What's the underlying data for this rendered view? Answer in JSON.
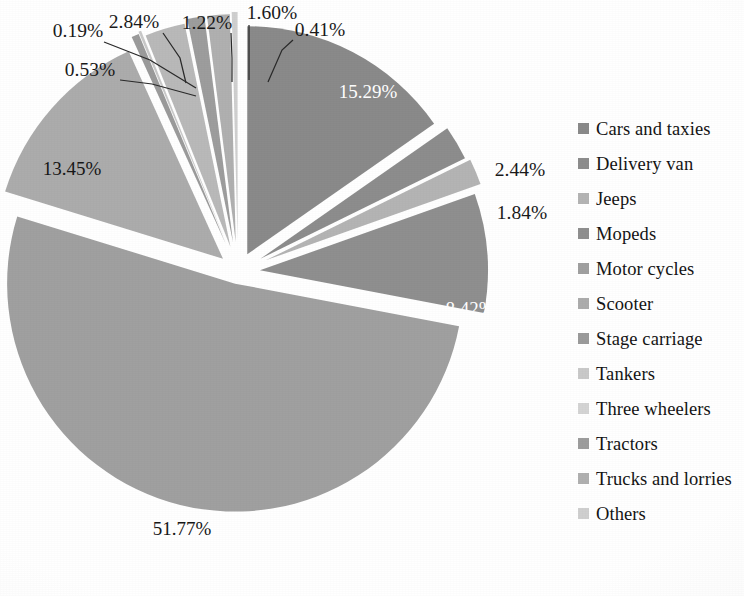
{
  "chart_data": {
    "type": "pie",
    "title": "",
    "subtitle": "",
    "xlabel": "",
    "ylabel": "",
    "legend_position": "right",
    "grid": false,
    "exploded": true,
    "value_suffix": "%",
    "categories": [
      "Cars and taxies",
      "Delivery van",
      "Jeeps",
      "Mopeds",
      "Motor cycles",
      "Scooter",
      "Stage carriage",
      "Tankers",
      "Three wheelers",
      "Tractors",
      "Trucks and lorries",
      "Others"
    ],
    "values": [
      15.29,
      2.44,
      1.84,
      8.42,
      51.77,
      13.45,
      0.53,
      0.19,
      2.84,
      1.22,
      1.6,
      0.41
    ],
    "labels": [
      "15.29%",
      "2.44%",
      "1.84%",
      "8.42%",
      "51.77%",
      "13.45%",
      "0.53%",
      "0.19%",
      "2.84%",
      "1.22%",
      "1.60%",
      "0.41%"
    ],
    "colors": [
      "#8a8a8a",
      "#8d8d8d",
      "#b4b4b4",
      "#8f8f8f",
      "#a0a0a0",
      "#acacac",
      "#9b9b9b",
      "#c9c9c9",
      "#b9b9b9",
      "#9d9d9d",
      "#b0b0b0",
      "#cfcfcf"
    ],
    "label_placement": [
      "inside",
      "outside",
      "outside",
      "inside",
      "inside",
      "inside",
      "callout",
      "callout",
      "callout",
      "callout",
      "callout",
      "callout"
    ]
  },
  "legend": {
    "items": [
      {
        "label": "Cars and taxies",
        "color": "#8a8a8a"
      },
      {
        "label": "Delivery van",
        "color": "#8d8d8d"
      },
      {
        "label": "Jeeps",
        "color": "#b4b4b4"
      },
      {
        "label": "Mopeds",
        "color": "#8f8f8f"
      },
      {
        "label": "Motor cycles",
        "color": "#a0a0a0"
      },
      {
        "label": "Scooter",
        "color": "#acacac"
      },
      {
        "label": "Stage carriage",
        "color": "#9b9b9b"
      },
      {
        "label": "Tankers",
        "color": "#c9c9c9"
      },
      {
        "label": "Three wheelers",
        "color": "#d4d4d4"
      },
      {
        "label": "Tractors",
        "color": "#9d9d9d"
      },
      {
        "label": "Trucks and lorries",
        "color": "#b0b0b0"
      },
      {
        "label": "Others",
        "color": "#cfcfcf"
      }
    ]
  },
  "pie_labels": {
    "cars_and_taxies": "15.29%",
    "delivery_van": "2.44%",
    "jeeps": "1.84%",
    "mopeds": "8.42%",
    "motor_cycles": "51.77%",
    "scooter": "13.45%",
    "stage_carriage": "0.53%",
    "tankers": "0.19%",
    "three_wheelers": "2.84%",
    "tractors": "1.22%",
    "trucks_and_lorries": "1.60%",
    "others": "0.41%"
  }
}
